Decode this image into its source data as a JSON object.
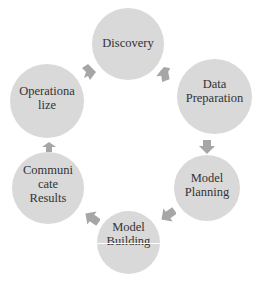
{
  "diagram": {
    "type": "cycle",
    "node_color": "#d9d9d9",
    "arrow_color": "#a6a6a6",
    "text_color": "#333333",
    "nodes": [
      {
        "id": "discovery",
        "label": "Discovery"
      },
      {
        "id": "data-preparation",
        "label": "Data\nPreparation"
      },
      {
        "id": "model-planning",
        "label": "Model\nPlanning"
      },
      {
        "id": "model-building",
        "label": "Model\nBuilding"
      },
      {
        "id": "communicate-results",
        "label": "Communi\ncate\nResults"
      },
      {
        "id": "operationalize",
        "label": "Operationa\nlize"
      }
    ],
    "edges": [
      [
        "discovery",
        "data-preparation"
      ],
      [
        "data-preparation",
        "model-planning"
      ],
      [
        "model-planning",
        "model-building"
      ],
      [
        "model-building",
        "communicate-results"
      ],
      [
        "communicate-results",
        "operationalize"
      ],
      [
        "operationalize",
        "discovery"
      ]
    ]
  }
}
